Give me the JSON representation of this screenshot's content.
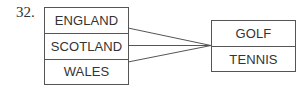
{
  "question_number": "32.",
  "domain_set": {
    "items": [
      "ENGLAND",
      "SCOTLAND",
      "WALES"
    ]
  },
  "codomain_set": {
    "items": [
      "GOLF",
      "TENNIS"
    ]
  },
  "mappings": [
    {
      "from": "ENGLAND",
      "to": "GOLF/TENNIS divider"
    },
    {
      "from": "SCOTLAND",
      "to": "GOLF/TENNIS divider"
    },
    {
      "from": "WALES",
      "to": "GOLF/TENNIS divider"
    }
  ],
  "colors": {
    "line": "#555555",
    "text": "#333333"
  }
}
